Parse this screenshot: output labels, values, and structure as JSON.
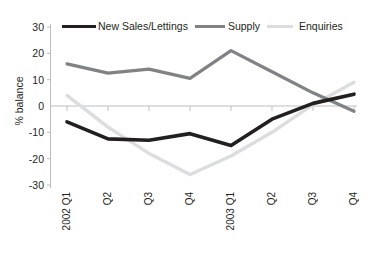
{
  "chart_data": {
    "type": "line",
    "title": "",
    "xlabel": "",
    "ylabel": "% balance",
    "categories": [
      "2002 Q1",
      "Q2",
      "Q3",
      "Q4",
      "2003 Q1",
      "Q2",
      "Q3",
      "Q4"
    ],
    "ylim": [
      -30,
      30
    ],
    "yticks": [
      30,
      20,
      10,
      0,
      -10,
      -20,
      -30
    ],
    "grid": false,
    "zero_line": true,
    "legend_position": "top",
    "series": [
      {
        "name": "New Sales/Lettings",
        "color": "#231f20",
        "values": [
          -6,
          -12.5,
          -13,
          -10.5,
          -15,
          -5,
          1,
          4.5
        ]
      },
      {
        "name": "Supply",
        "color": "#808285",
        "values": [
          16,
          12.5,
          14,
          10.5,
          21,
          13,
          5,
          -2
        ]
      },
      {
        "name": "Enquiries",
        "color": "#dcdddf",
        "values": [
          4,
          -8,
          -18,
          -26,
          -19,
          -10,
          0.5,
          9
        ]
      }
    ]
  },
  "axis": {
    "tick_labels_y": [
      "30",
      "20",
      "10",
      "0",
      "-10",
      "-20",
      "-30"
    ],
    "tick_labels_x": [
      "2002 Q1",
      "Q2",
      "Q3",
      "Q4",
      "2003 Q1",
      "Q2",
      "Q3",
      "Q4"
    ],
    "y_title": "% balance"
  },
  "legend": {
    "items": [
      {
        "label": "New Sales/Lettings",
        "color": "#231f20"
      },
      {
        "label": "Supply",
        "color": "#808285"
      },
      {
        "label": "Enquiries",
        "color": "#dcdddf"
      }
    ]
  },
  "colors": {
    "background": "#ffffff",
    "axis": "#bcbec0",
    "text": "#231f20"
  }
}
